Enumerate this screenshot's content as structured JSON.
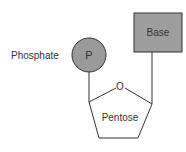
{
  "diagram": {
    "type": "nucleotide-structure",
    "components": {
      "phosphate": {
        "label": "Phosphate",
        "symbol": "P",
        "fill": "#9a9a9a",
        "stroke": "#333333"
      },
      "base": {
        "label": "Base",
        "fill": "#9e9e9e",
        "stroke": "#333333"
      },
      "pentose": {
        "label": "Pentose",
        "ring_atom": "O",
        "stroke": "#333333"
      }
    },
    "connections": [
      {
        "from": "phosphate",
        "to": "pentose"
      },
      {
        "from": "base",
        "to": "pentose"
      }
    ]
  }
}
